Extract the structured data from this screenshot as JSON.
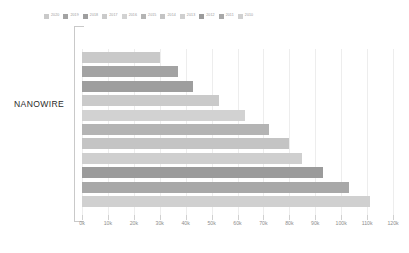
{
  "chart": {
    "type": "bar",
    "orientation": "horizontal",
    "category_label": "NANOWIRE"
  },
  "legend": {
    "position": "top",
    "entries": [
      {
        "label": "2020",
        "color": "#c9c9c9"
      },
      {
        "label": "2019",
        "color": "#a3a3a3"
      },
      {
        "label": "2018",
        "color": "#9e9e9e"
      },
      {
        "label": "2017",
        "color": "#cacaca"
      },
      {
        "label": "2016",
        "color": "#d2d2d2"
      },
      {
        "label": "2015",
        "color": "#b4b4b4"
      },
      {
        "label": "2014",
        "color": "#c4c4c4"
      },
      {
        "label": "2013",
        "color": "#cfcfcf"
      },
      {
        "label": "2012",
        "color": "#9b9b9b"
      },
      {
        "label": "2011",
        "color": "#a8a8a8"
      },
      {
        "label": "2010",
        "color": "#d0d0d0"
      }
    ]
  },
  "xaxis": {
    "ticks": [
      "0k",
      "10k",
      "20k",
      "30k",
      "40k",
      "50k",
      "60k",
      "70k",
      "80k",
      "90k",
      "100k",
      "110k",
      "120k"
    ],
    "min": 0,
    "max": 120000,
    "step": 10000
  },
  "chart_data": {
    "type": "bar",
    "title": "",
    "subtitle": "",
    "xlabel": "",
    "ylabel": "NANOWIRE",
    "xlim": [
      0,
      120000
    ],
    "grid": true,
    "legend_position": "top",
    "categories": [
      "NANOWIRE"
    ],
    "tick_labels": [
      "0k",
      "10k",
      "20k",
      "30k",
      "40k",
      "50k",
      "60k",
      "70k",
      "80k",
      "90k",
      "100k",
      "110k",
      "120k"
    ],
    "series": [
      {
        "name": "2020",
        "values": [
          30000
        ],
        "color": "#c9c9c9"
      },
      {
        "name": "2019",
        "values": [
          37000
        ],
        "color": "#a3a3a3"
      },
      {
        "name": "2018",
        "values": [
          43000
        ],
        "color": "#9e9e9e"
      },
      {
        "name": "2017",
        "values": [
          53000
        ],
        "color": "#cacaca"
      },
      {
        "name": "2016",
        "values": [
          63000
        ],
        "color": "#d2d2d2"
      },
      {
        "name": "2015",
        "values": [
          72000
        ],
        "color": "#b4b4b4"
      },
      {
        "name": "2014",
        "values": [
          80000
        ],
        "color": "#c4c4c4"
      },
      {
        "name": "2013",
        "values": [
          85000
        ],
        "color": "#cfcfcf"
      },
      {
        "name": "2012",
        "values": [
          93000
        ],
        "color": "#9b9b9b"
      },
      {
        "name": "2011",
        "values": [
          103000
        ],
        "color": "#a8a8a8"
      },
      {
        "name": "2010",
        "values": [
          111000
        ],
        "color": "#d0d0d0"
      }
    ]
  }
}
